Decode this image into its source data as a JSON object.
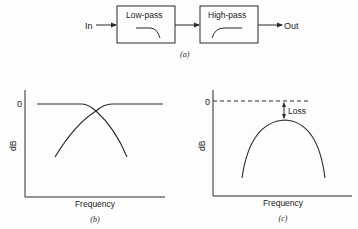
{
  "panel_a": {
    "caption": "(a)",
    "input_label": "In",
    "output_label": "Out",
    "blocks": [
      {
        "label": "Low-pass",
        "icon": "lowpass-response-icon"
      },
      {
        "label": "High-pass",
        "icon": "highpass-response-icon"
      }
    ]
  },
  "panel_b": {
    "caption": "(b)",
    "ylabel": "dB",
    "xlabel": "Frequency",
    "zero_label": "0"
  },
  "panel_c": {
    "caption": "(c)",
    "ylabel": "dB",
    "xlabel": "Frequency",
    "zero_label": "0",
    "loss_label": "Loss"
  },
  "colors": {
    "line": "#2a2a2a",
    "text": "#222222",
    "background": "#fdfdfd"
  }
}
